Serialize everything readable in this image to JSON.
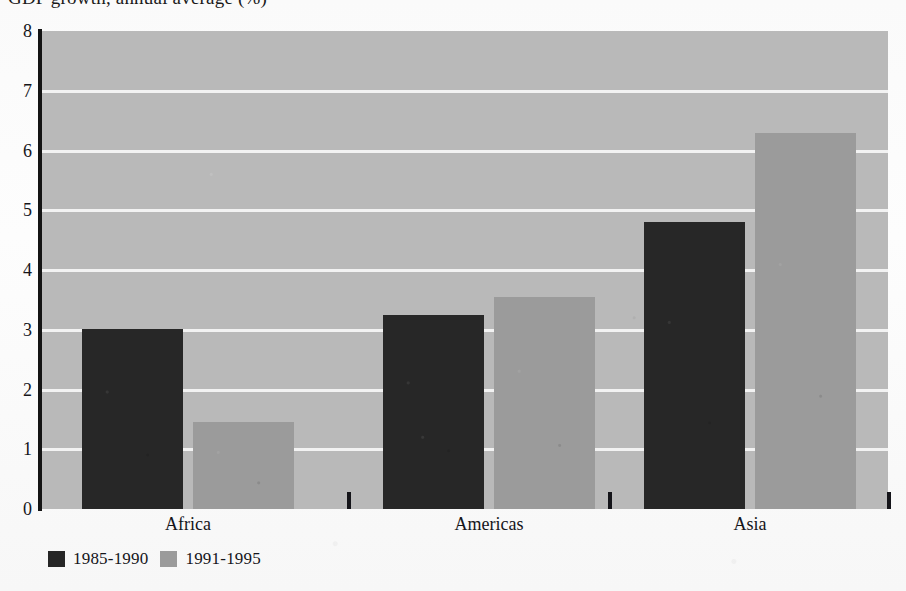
{
  "chart_data": {
    "type": "bar",
    "title": "GDP growth, annual average (%)",
    "title_note": "clipped at top edge of scan",
    "xlabel": "",
    "ylabel": "",
    "ylim": [
      0,
      8
    ],
    "yticks": [
      "0",
      "1",
      "2",
      "3",
      "4",
      "5",
      "6",
      "7",
      "8"
    ],
    "grid": true,
    "legend_position": "bottom-left",
    "categories": [
      "Africa",
      "Americas",
      "Asia"
    ],
    "series": [
      {
        "name": "1985-1990",
        "color": "#272727",
        "values": [
          3.02,
          3.25,
          4.8
        ]
      },
      {
        "name": "1991-1995",
        "color": "#9b9b9b",
        "values": [
          1.45,
          3.55,
          6.3
        ]
      }
    ]
  },
  "plot": {
    "background_color": "#b9b9b9",
    "gridline_color": "#f2f2f2",
    "axis_color": "#141414"
  }
}
